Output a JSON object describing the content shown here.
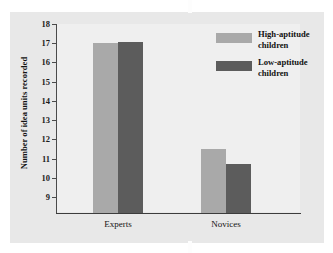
{
  "chart_data": {
    "type": "bar",
    "title": "",
    "xlabel": "",
    "ylabel": "Number of idea units recorded",
    "categories": [
      "Experts",
      "Novices"
    ],
    "ylim": [
      9,
      18
    ],
    "yticks": [
      18,
      17,
      16,
      15,
      14,
      13,
      12,
      11,
      10,
      9
    ],
    "ytick_labels": [
      "18",
      "17",
      "16",
      "15",
      "14",
      "13",
      "12",
      "11",
      "10",
      "9"
    ],
    "grid": false,
    "legend_position": "top-right",
    "series": [
      {
        "name": "High-aptitude children",
        "color": "#a9a9a9",
        "values": [
          17.0,
          11.5
        ]
      },
      {
        "name": "Low-aptitude children",
        "color": "#5c5c5c",
        "values": [
          17.05,
          10.7
        ]
      }
    ]
  },
  "legend": {
    "entries": [
      {
        "label_line1": "High-aptitude",
        "label_line2": "children",
        "swatch": "#a9a9a9"
      },
      {
        "label_line1": "Low-aptitude",
        "label_line2": "children",
        "swatch": "#5c5c5c"
      }
    ]
  },
  "axes": {
    "y_title": "Number of idea units recorded",
    "y_labels": [
      "18",
      "17",
      "16",
      "15",
      "14",
      "13",
      "12",
      "11",
      "10",
      "9"
    ],
    "x_labels": [
      "Experts",
      "Novices"
    ]
  },
  "colors": {
    "panel_background": "#e8e8e8",
    "plot_background": "#efefef",
    "axis": "#4a4a4a",
    "light_bar": "#a9a9a9",
    "dark_bar": "#5c5c5c",
    "text": "#121212"
  }
}
